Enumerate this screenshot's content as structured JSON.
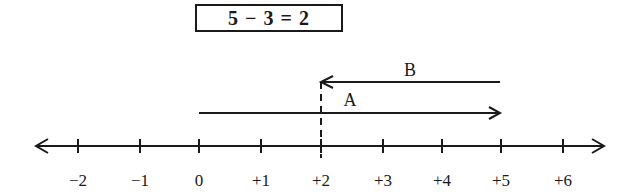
{
  "equation": "5 − 3 = 2",
  "number_line": {
    "ticks": [
      {
        "label": "−2",
        "value": -2,
        "x": 78
      },
      {
        "label": "−1",
        "value": -1,
        "x": 140
      },
      {
        "label": "0",
        "value": 0,
        "x": 199
      },
      {
        "label": "+1",
        "value": 1,
        "x": 261
      },
      {
        "label": "+2",
        "value": 2,
        "x": 321
      },
      {
        "label": "+3",
        "value": 3,
        "x": 383
      },
      {
        "label": "+4",
        "value": 4,
        "x": 442
      },
      {
        "label": "+5",
        "value": 5,
        "x": 501
      },
      {
        "label": "+6",
        "value": 6,
        "x": 563
      }
    ]
  },
  "arrows": {
    "A": {
      "label": "A",
      "from": 0,
      "to": 5
    },
    "B": {
      "label": "B",
      "from": 5,
      "to": 2
    }
  },
  "colors": {
    "ink": "#1a1a1a",
    "background": "#ffffff"
  }
}
